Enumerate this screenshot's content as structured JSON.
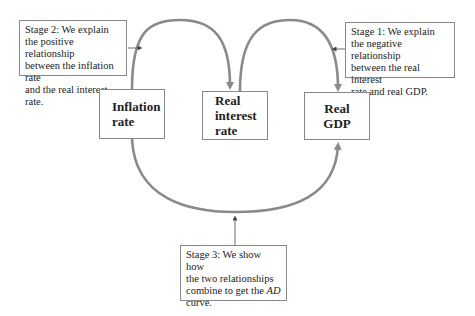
{
  "diagram": {
    "nodes": [
      {
        "id": "inflation",
        "lines": [
          "Inflation",
          "rate"
        ]
      },
      {
        "id": "real-interest",
        "lines": [
          "Real",
          "interest",
          "rate"
        ]
      },
      {
        "id": "real-gdp",
        "lines": [
          "Real",
          "GDP"
        ]
      }
    ],
    "stages": {
      "stage2": {
        "lines": [
          "Stage 2:  We explain",
          "the positive relationship",
          "between the inflation rate",
          "and the real interest rate."
        ]
      },
      "stage1": {
        "lines": [
          "Stage 1:  We explain",
          "the negative relationship",
          "between the real interest",
          "rate and real GDP."
        ]
      },
      "stage3": {
        "lines": [
          "Stage 3:  We show how",
          "the two relationships",
          "combine to get the"
        ],
        "em": "AD",
        "last": "curve."
      }
    },
    "edges": [
      {
        "from": "inflation",
        "to": "real-interest",
        "label": "Stage 2"
      },
      {
        "from": "real-interest",
        "to": "real-gdp",
        "label": "Stage 1"
      },
      {
        "from": "inflation",
        "to": "real-gdp",
        "label": "Stage 3"
      }
    ],
    "colors": {
      "arc": "#8a8a8a",
      "border": "#888888",
      "text": "#222222"
    }
  }
}
